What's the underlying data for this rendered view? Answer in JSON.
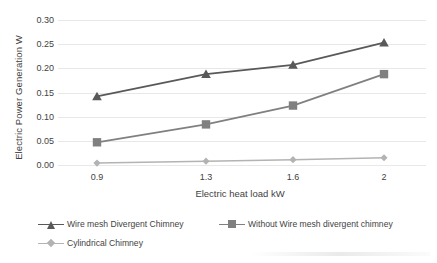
{
  "chart_data": {
    "type": "line",
    "title": "",
    "xlabel": "Electric heat load kW",
    "ylabel": "Electric Power Generation W",
    "categories": [
      "0.9",
      "1.3",
      "1.6",
      "2"
    ],
    "x_values": [
      0.9,
      1.3,
      1.6,
      2
    ],
    "ylim": [
      0.0,
      0.3
    ],
    "ytick_labels": [
      "0.00",
      "0.05",
      "0.10",
      "0.15",
      "0.20",
      "0.25",
      "0.30"
    ],
    "ytick_values": [
      0.0,
      0.05,
      0.1,
      0.15,
      0.2,
      0.25,
      0.3
    ],
    "grid": "horizontal",
    "legend_position": "bottom",
    "series": [
      {
        "name": "Wire mesh Divergent Chimney",
        "marker": "triangle",
        "color": "#595959",
        "values": [
          0.142,
          0.188,
          0.207,
          0.253
        ]
      },
      {
        "name": "Without Wire mesh divergent chimney",
        "marker": "square",
        "color": "#808080",
        "values": [
          0.047,
          0.084,
          0.123,
          0.188
        ]
      },
      {
        "name": "Cylindrical Chimney",
        "marker": "diamond",
        "color": "#b3b3b3",
        "values": [
          0.004,
          0.008,
          0.011,
          0.015
        ]
      }
    ]
  },
  "legend": {
    "items": [
      {
        "label": "Wire mesh Divergent Chimney"
      },
      {
        "label": "Without Wire mesh divergent chimney"
      },
      {
        "label": "Cylindrical Chimney"
      }
    ]
  }
}
